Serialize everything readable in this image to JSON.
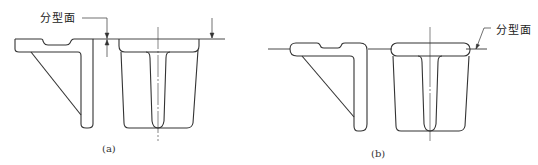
{
  "figure_a": {
    "label": "分型面",
    "caption": "(a)"
  },
  "figure_b": {
    "label": "分型面",
    "caption": "(b)"
  },
  "colors": {
    "line": "#333333",
    "background": "#ffffff"
  }
}
